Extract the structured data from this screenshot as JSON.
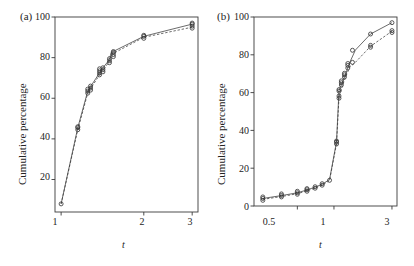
{
  "figure": {
    "panels": [
      {
        "id": "a",
        "label": "(a)",
        "ylabel": "Cumulative percentage",
        "xlabel": "t"
      },
      {
        "id": "b",
        "label": "(b)",
        "ylabel": "Cumulative percentage",
        "xlabel": "t"
      }
    ]
  },
  "chart_data": [
    {
      "type": "scatter",
      "panel": "(a)",
      "title": "",
      "xlabel": "t",
      "ylabel": "Cumulative percentage",
      "xscale": "log",
      "xlim": [
        0.95,
        3.15
      ],
      "ylim": [
        4,
        100
      ],
      "xticks": [
        1,
        2,
        3
      ],
      "xtick_labels": [
        "1",
        "2",
        "3"
      ],
      "yticks": [
        20,
        40,
        60,
        80,
        100
      ],
      "ytick_labels": [
        "20",
        "40",
        "60",
        "80",
        "100"
      ],
      "grid": false,
      "legend": "none",
      "marker": "open-circle",
      "linestyle": "dashed",
      "series": [
        {
          "name": "series-1",
          "x": [
            1.0,
            1.15,
            1.25,
            1.27,
            1.38,
            1.4,
            1.5,
            1.52,
            2.0,
            3.0
          ],
          "values": [
            8.0,
            45.5,
            63.5,
            65.0,
            72.5,
            74.0,
            79.0,
            82.5,
            90.5,
            96.5
          ]
        },
        {
          "name": "series-2",
          "x": [
            1.0,
            1.15,
            1.25,
            1.27,
            1.38,
            1.4,
            1.5,
            1.52,
            2.0,
            3.0
          ],
          "values": [
            8.0,
            44.5,
            62.5,
            64.0,
            71.5,
            73.0,
            78.0,
            81.5,
            90.0,
            95.0
          ]
        }
      ],
      "marker_clusters": [
        {
          "x": 1.0,
          "ys": [
            8.0
          ]
        },
        {
          "x": 1.15,
          "ys": [
            44.5,
            45.5,
            46.0
          ]
        },
        {
          "x": 1.25,
          "ys": [
            62.5,
            63.5,
            64.5
          ]
        },
        {
          "x": 1.28,
          "ys": [
            64.0,
            65.0,
            66.0
          ]
        },
        {
          "x": 1.38,
          "ys": [
            71.5,
            72.5,
            73.5,
            74.5
          ]
        },
        {
          "x": 1.42,
          "ys": [
            73.0,
            74.0,
            75.0
          ]
        },
        {
          "x": 1.5,
          "ys": [
            77.5,
            78.5,
            79.5
          ]
        },
        {
          "x": 1.55,
          "ys": [
            80.5,
            81.5,
            82.5,
            83.0
          ]
        },
        {
          "x": 2.0,
          "ys": [
            89.5,
            90.5,
            91.0
          ]
        },
        {
          "x": 3.0,
          "ys": [
            94.5,
            95.5,
            96.5,
            97.0
          ]
        }
      ]
    },
    {
      "type": "scatter",
      "panel": "(b)",
      "title": "",
      "xlabel": "t",
      "ylabel": "Cumulative percentage",
      "xscale": "log",
      "xlim": [
        0.22,
        3.3
      ],
      "ylim": [
        0,
        100
      ],
      "xticks": [
        0.5,
        1,
        3
      ],
      "xtick_labels": [
        "0.5",
        "1",
        "3"
      ],
      "yticks": [
        0,
        20,
        40,
        60,
        80,
        100
      ],
      "ytick_labels": [
        "0",
        "20",
        "40",
        "60",
        "80",
        "100"
      ],
      "grid": false,
      "legend": "none",
      "marker": "open-circle",
      "linestyle": "dashed",
      "series": [
        {
          "name": "series-1",
          "x": [
            0.26,
            0.37,
            0.5,
            0.6,
            0.7,
            0.8,
            0.92,
            1.05,
            1.1,
            1.18,
            1.25,
            1.35,
            1.5,
            2.0,
            3.0
          ],
          "values": [
            4.0,
            5.5,
            7.0,
            8.5,
            10.0,
            11.5,
            14.0,
            34.0,
            61.0,
            66.0,
            70.0,
            76.0,
            82.5,
            91.0,
            97.0
          ]
        },
        {
          "name": "series-2",
          "x": [
            0.26,
            0.37,
            0.5,
            0.6,
            0.7,
            0.8,
            0.92,
            1.05,
            1.1,
            1.18,
            1.25,
            1.35,
            1.5,
            2.0,
            3.0
          ],
          "values": [
            3.5,
            5.0,
            6.5,
            8.0,
            9.5,
            11.0,
            13.5,
            33.0,
            57.5,
            64.0,
            68.5,
            73.5,
            76.0,
            84.5,
            92.5
          ]
        }
      ],
      "marker_clusters": [
        {
          "x": 0.26,
          "ys": [
            3.0,
            4.0,
            4.8
          ]
        },
        {
          "x": 0.37,
          "ys": [
            4.8,
            5.6,
            6.4
          ]
        },
        {
          "x": 0.5,
          "ys": [
            6.2,
            7.0,
            7.8
          ]
        },
        {
          "x": 0.6,
          "ys": [
            7.8,
            8.6,
            9.2
          ]
        },
        {
          "x": 0.7,
          "ys": [
            9.4,
            10.2
          ]
        },
        {
          "x": 0.8,
          "ys": [
            11.0,
            11.8
          ]
        },
        {
          "x": 0.92,
          "ys": [
            13.6
          ]
        },
        {
          "x": 1.05,
          "ys": [
            32.8,
            33.8,
            34.4
          ]
        },
        {
          "x": 1.1,
          "ys": [
            57.0,
            58.2,
            60.8,
            61.6
          ]
        },
        {
          "x": 1.15,
          "ys": [
            64.0,
            65.2,
            66.2
          ]
        },
        {
          "x": 1.22,
          "ys": [
            68.2,
            69.4,
            70.2
          ]
        },
        {
          "x": 1.3,
          "ys": [
            73.0,
            74.4,
            75.4
          ]
        },
        {
          "x": 1.42,
          "ys": [
            76.0,
            82.4
          ]
        },
        {
          "x": 2.0,
          "ys": [
            84.0,
            85.0,
            91.0
          ]
        },
        {
          "x": 3.0,
          "ys": [
            91.8,
            92.8,
            97.0
          ]
        }
      ]
    }
  ]
}
